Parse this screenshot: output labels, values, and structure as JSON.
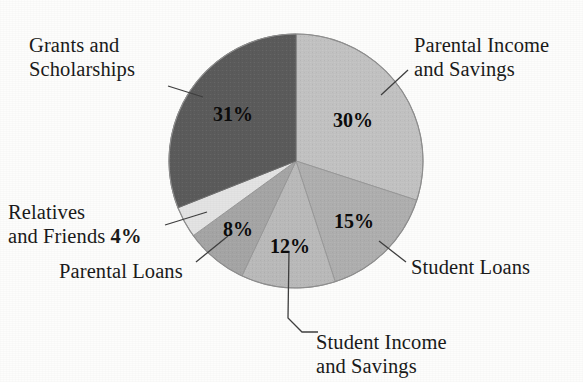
{
  "chart_data": {
    "type": "pie",
    "title": "",
    "subtitle": "",
    "xlabel": "",
    "ylabel": "",
    "legend_position": "none",
    "grid": false,
    "labels_with_leader_lines": true,
    "value_unit": "percent",
    "total": 100,
    "start_angle_deg": 0,
    "direction": "clockwise",
    "categories": [
      "Parental Income and Savings",
      "Student Loans",
      "Student Income and Savings",
      "Parental Loans",
      "Relatives and Friends",
      "Grants and Scholarships"
    ],
    "values": [
      30,
      15,
      12,
      8,
      4,
      31
    ],
    "slices": [
      {
        "name": "parental-income-and-savings",
        "label_line1": "Parental Income",
        "label_line2": "and Savings",
        "value": 30,
        "value_label": "30%",
        "color": "#c3c3c3",
        "start_deg": 0,
        "end_deg": 108
      },
      {
        "name": "student-loans",
        "label_line1": "Student Loans",
        "label_line2": "",
        "value": 15,
        "value_label": "15%",
        "color": "#b0b0b0",
        "start_deg": 108,
        "end_deg": 162
      },
      {
        "name": "student-income-and-savings",
        "label_line1": "Student Income",
        "label_line2": "and Savings",
        "value": 12,
        "value_label": "12%",
        "color": "#bbbbbb",
        "start_deg": 162,
        "end_deg": 205.2
      },
      {
        "name": "parental-loans",
        "label_line1": "Parental Loans",
        "label_line2": "",
        "value": 8,
        "value_label": "8%",
        "color": "#a6a6a6",
        "start_deg": 205.2,
        "end_deg": 234
      },
      {
        "name": "relatives-and-friends",
        "label_line1": "Relatives",
        "label_line2": "and Friends",
        "value": 4,
        "value_label": "4%",
        "color": "#e4e4e4",
        "start_deg": 234,
        "end_deg": 248.4
      },
      {
        "name": "grants-and-scholarships",
        "label_line1": "Grants and",
        "label_line2": "Scholarships",
        "value": 31,
        "value_label": "31%",
        "color": "#5c5c5c",
        "start_deg": 248.4,
        "end_deg": 360
      }
    ]
  },
  "labels": {
    "grants": {
      "line1": "Grants and",
      "line2": "Scholarships"
    },
    "parental_income": {
      "line1": "Parental Income",
      "line2": "and Savings"
    },
    "relatives": {
      "line1": "Relatives",
      "line2_text": "and Friends",
      "line2_pct": "4%"
    },
    "parental_loans": {
      "line1": "Parental Loans"
    },
    "student_loans": {
      "line1": "Student Loans"
    },
    "student_income": {
      "line1": "Student Income",
      "line2": "and Savings"
    }
  },
  "slice_percent_labels": {
    "grants": "31%",
    "parental_income": "30%",
    "student_loans": "15%",
    "student_income": "12%",
    "parental_loans": "8%"
  },
  "colors": {
    "background": "#fdfdfc",
    "text": "#1a1a1a",
    "leader_line": "#4a4a4a",
    "pie_outline": "#8a8a8a"
  }
}
